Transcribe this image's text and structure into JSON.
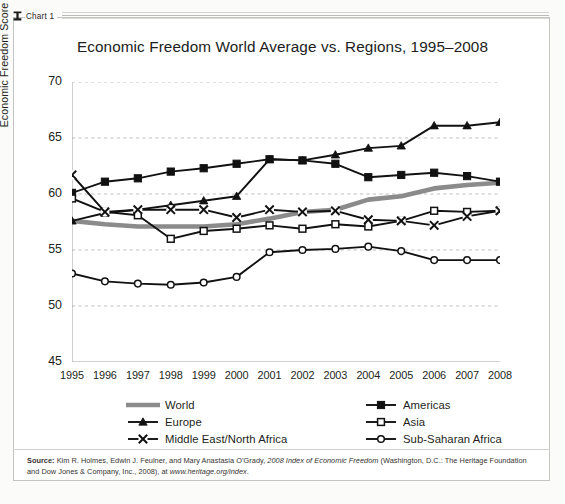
{
  "tab": {
    "label": "Chart 1",
    "icon": "chart-tab-icon"
  },
  "chart_data": {
    "type": "line",
    "title": "Economic Freedom World Average vs. Regions, 1995–2008",
    "xlabel": "",
    "ylabel": "Economic Freedom Score",
    "grid": true,
    "legend_position": "bottom",
    "ylim": [
      45,
      70
    ],
    "yticks": [
      70,
      65,
      60,
      55,
      50,
      45
    ],
    "categories": [
      1995,
      1996,
      1997,
      1998,
      1999,
      2000,
      2001,
      2002,
      2003,
      2004,
      2005,
      2006,
      2007,
      2008
    ],
    "xticks": [
      "1995",
      "1996",
      "1997",
      "1998",
      "1999",
      "2000",
      "2001",
      "2002",
      "2003",
      "2004",
      "2005",
      "2006",
      "2007",
      "2008"
    ],
    "series": [
      {
        "name": "World",
        "marker": "none",
        "style": "thick-gray-line",
        "color": "#8b8b8b",
        "values": [
          57.6,
          57.3,
          57.1,
          57.1,
          57.1,
          57.3,
          57.8,
          58.4,
          58.6,
          59.5,
          59.8,
          60.5,
          60.8,
          61.0
        ]
      },
      {
        "name": "Americas",
        "marker": "filled-square",
        "style": "line-marker",
        "color": "#111111",
        "values": [
          60.1,
          61.1,
          61.4,
          62.0,
          62.3,
          62.7,
          63.1,
          63.0,
          62.7,
          61.5,
          61.7,
          61.9,
          61.6,
          61.1
        ]
      },
      {
        "name": "Europe",
        "marker": "filled-triangle",
        "style": "line-marker",
        "color": "#111111",
        "values": [
          57.6,
          58.3,
          58.6,
          59.0,
          59.4,
          59.8,
          63.1,
          63.0,
          63.5,
          64.1,
          64.3,
          66.1,
          66.1,
          66.4
        ]
      },
      {
        "name": "Asia",
        "marker": "open-square",
        "style": "line-marker",
        "color": "#111111",
        "values": [
          59.6,
          58.4,
          58.1,
          56.0,
          56.7,
          56.9,
          57.2,
          56.9,
          57.3,
          57.1,
          57.6,
          58.5,
          58.4,
          58.5
        ]
      },
      {
        "name": "Middle East/North Africa",
        "marker": "cross-x",
        "style": "line-marker",
        "color": "#111111",
        "values": [
          61.7,
          58.4,
          58.6,
          58.6,
          58.6,
          57.9,
          58.6,
          58.4,
          58.5,
          57.7,
          57.6,
          57.2,
          58.0,
          58.5
        ]
      },
      {
        "name": "Sub-Saharan Africa",
        "marker": "open-circle",
        "style": "line-marker",
        "color": "#111111",
        "values": [
          52.9,
          52.2,
          52.0,
          51.9,
          52.1,
          52.6,
          54.8,
          55.0,
          55.1,
          55.3,
          54.9,
          54.1,
          54.1,
          54.1
        ]
      }
    ]
  },
  "legend": {
    "entries": [
      {
        "label": "World",
        "key": "thick-gray-line-key"
      },
      {
        "label": "Americas",
        "key": "filled-square-key"
      },
      {
        "label": "Europe",
        "key": "filled-triangle-key"
      },
      {
        "label": "Asia",
        "key": "open-square-key"
      },
      {
        "label": "Middle East/North Africa",
        "key": "cross-x-key"
      },
      {
        "label": "Sub-Saharan Africa",
        "key": "open-circle-key"
      }
    ]
  },
  "source": {
    "label": "Source:",
    "line1_a": " Kim R. Holmes, Edwin J. Feulner, and Mary Anastasia O’Grady, ",
    "line1_italic": "2008 Index of Economic Freedom",
    "line1_b": " (Washington, D.C.: The Heritage Foundation and Dow Jones & Company, Inc., 2008), at ",
    "line2_italic": "www.heritage.org/index",
    "line2_b": "."
  },
  "colors": {
    "world_gray": "#8b8b8b",
    "series_black": "#111111",
    "grid": "#b9b8b6",
    "axis": "#a9a8a6",
    "panel_border": "#c5c4c2",
    "background": "#ffffff"
  }
}
